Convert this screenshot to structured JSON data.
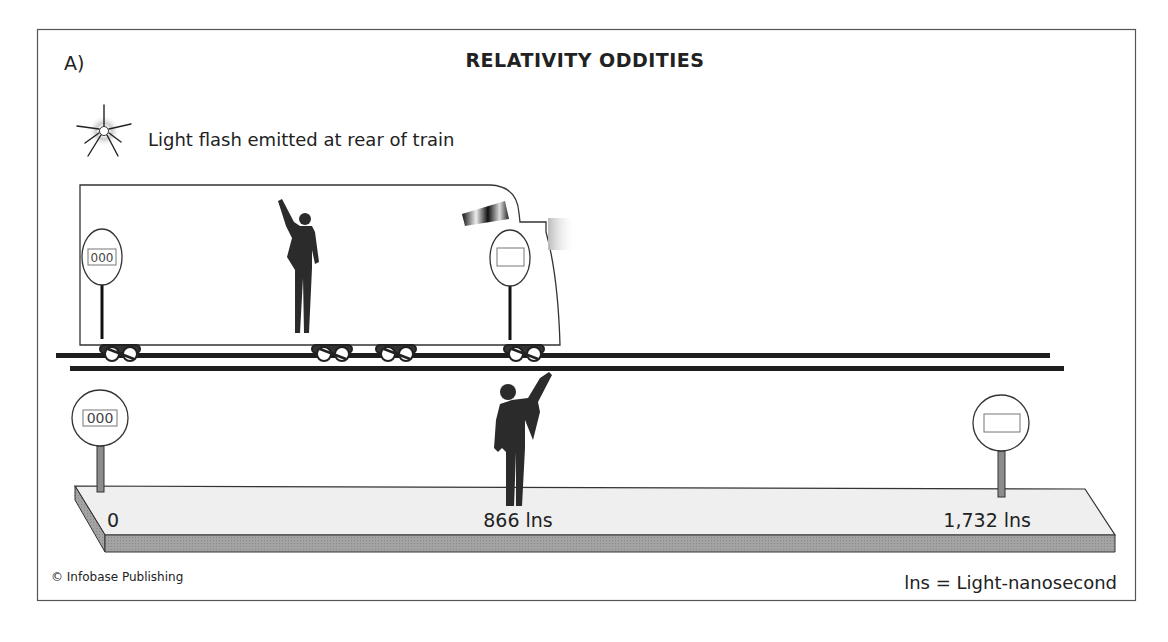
{
  "figure": {
    "panel_label": "A)",
    "title": "RELATIVITY ODDITIES",
    "flash_caption": "Light flash emitted at rear of train",
    "train": {
      "rear_clock_display": "000",
      "front_clock_display": ""
    },
    "platform": {
      "left_clock_display": "000",
      "right_clock_display": "",
      "marks": [
        {
          "label": "0"
        },
        {
          "label": "866 lns"
        },
        {
          "label": "1,732 lns"
        }
      ]
    },
    "credit": "© Infobase Publishing",
    "legend": "lns = Light-nanosecond"
  },
  "colors": {
    "frame": "#555555",
    "silhouette": "#2b2b2b",
    "platform_top": "#efefef",
    "platform_side": "#9a9a9a",
    "post": "#8c8c8c",
    "rail": "#1e1e1e"
  }
}
